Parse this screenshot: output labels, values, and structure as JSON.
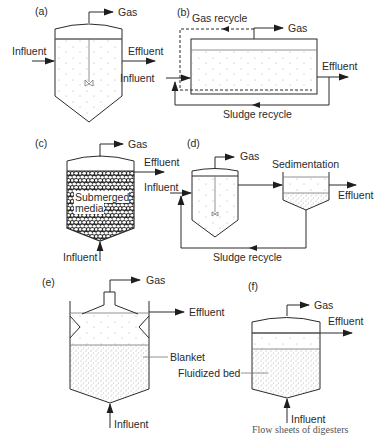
{
  "figure": {
    "panels": [
      {
        "id": "a",
        "label": "(a)",
        "gas": "Gas",
        "influent": "Influent",
        "effluent": "Effluent"
      },
      {
        "id": "b",
        "label": "(b)",
        "gas": "Gas",
        "gas_recycle": "Gas recycle",
        "influent": "Influent",
        "effluent": "Effluent",
        "sludge_recycle": "Sludge recycle"
      },
      {
        "id": "c",
        "label": "(c)",
        "gas": "Gas",
        "effluent": "Effluent",
        "media_line1": "Submerged",
        "media_line2": "media",
        "influent": "Influent"
      },
      {
        "id": "d",
        "label": "(d)",
        "gas": "Gas",
        "influent": "Influent",
        "sedimentation": "Sedimentation",
        "effluent": "Effluent",
        "sludge_recycle": "Sludge recycle"
      },
      {
        "id": "e",
        "label": "(e)",
        "gas": "Gas",
        "effluent": "Effluent",
        "blanket": "Blanket",
        "influent": "Influent"
      },
      {
        "id": "f",
        "label": "(f)",
        "gas": "Gas",
        "effluent": "Effluent",
        "fluidized_bed": "Fluidized bed",
        "influent": "Influent"
      }
    ],
    "caption_fragment": "Flow sheets of digesters"
  }
}
